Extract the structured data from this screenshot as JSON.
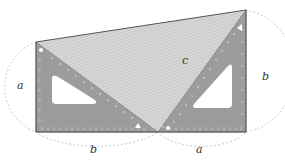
{
  "diagram": {
    "labels": {
      "left_side": "a",
      "bottom_left": "b",
      "bottom_right": "a",
      "right_side": "b",
      "hypotenuse": "c"
    },
    "colors": {
      "set_square": "#9a9a9a",
      "set_square_edge": "#7a7a7a",
      "hatch_fill": "#d4d4d4",
      "hatch_line": "#b8b8b8",
      "outline": "#555555",
      "arc": "#b5b5b5",
      "cutout": "#ffffff"
    }
  }
}
